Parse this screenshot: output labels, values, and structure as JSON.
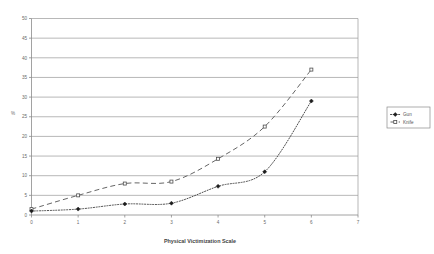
{
  "chart_data": {
    "type": "line",
    "title": "",
    "xlabel": "Physical Victimization Scale",
    "ylabel": "%",
    "x": [
      0,
      1,
      2,
      3,
      4,
      5,
      6
    ],
    "xlim": [
      0,
      7
    ],
    "ylim": [
      0,
      50
    ],
    "xticks": [
      "0",
      "1",
      "2",
      "3",
      "4",
      "5",
      "6",
      "7"
    ],
    "yticks": [
      "0",
      "5",
      "10",
      "15",
      "20",
      "25",
      "30",
      "35",
      "40",
      "45",
      "50"
    ],
    "grid": "horizontal",
    "legend_position": "right",
    "series": [
      {
        "name": "Gun",
        "marker": "filled-diamond",
        "linestyle": "dotted",
        "color": "#1c1c1c",
        "values": [
          1,
          1.5,
          2.8,
          3,
          7.3,
          11,
          29
        ]
      },
      {
        "name": "Knife",
        "marker": "open-square",
        "linestyle": "dashed",
        "color": "#4d4d4d",
        "values": [
          1.5,
          5,
          8,
          8.5,
          14.3,
          22.5,
          37
        ]
      }
    ]
  },
  "legend": {
    "items": [
      {
        "label": "Gun"
      },
      {
        "label": "Knife"
      }
    ]
  },
  "axes": {
    "x_title": "Physical Victimization Scale",
    "y_title": "%"
  }
}
